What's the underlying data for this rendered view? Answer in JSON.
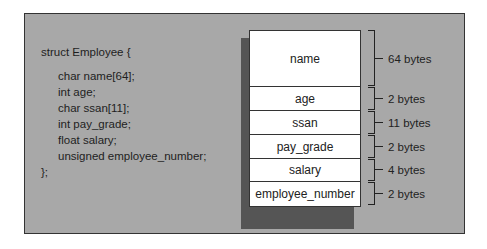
{
  "code": {
    "header": "struct Employee {",
    "fields": [
      "char name[64];",
      "int age;",
      "char ssan[11];",
      "int pay_grade;",
      "float salary;",
      "unsigned employee_number;"
    ],
    "footer": "};"
  },
  "memory_layout": {
    "rows": [
      {
        "field": "name",
        "size": "64 bytes",
        "height": 56
      },
      {
        "field": "age",
        "size": "2 bytes",
        "height": 24
      },
      {
        "field": "ssan",
        "size": "11 bytes",
        "height": 24
      },
      {
        "field": "pay_grade",
        "size": "2 bytes",
        "height": 24
      },
      {
        "field": "salary",
        "size": "4 bytes",
        "height": 23
      },
      {
        "field": "employee_number",
        "size": "2 bytes",
        "height": 24
      }
    ]
  },
  "colors": {
    "frame_bg": "#a8a8a8",
    "shadow": "#555555",
    "cell_bg": "#ffffff",
    "line": "#222222"
  }
}
